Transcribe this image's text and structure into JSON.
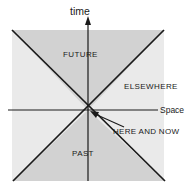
{
  "diagram": {
    "title_label": "time",
    "labels": {
      "time_axis": "time",
      "future_cone": "FUTURE",
      "elsewhere_region": "ELSEWHERE",
      "space_axis": "Space",
      "origin_event": "HERE AND NOW",
      "past_cone": "PAST"
    },
    "colors": {
      "cone_fill": "#d2d2d2",
      "band_fill": "#d2d2d2",
      "line": "#1a1a1a",
      "text": "#1a1a1a",
      "background": "#ffffff"
    },
    "geometry": {
      "origin_x": 88,
      "origin_y": 110,
      "time_axis_top_y": 18,
      "time_axis_bottom_y": 181,
      "space_axis_left_x": 8,
      "space_axis_right_x": 158,
      "band_top_y": 30,
      "band_bottom_y": 181,
      "cone_left_top_x": 12,
      "cone_right_top_x": 164,
      "cone_left_bottom_x": 13,
      "cone_right_bottom_x": 165,
      "pointer_tail_x": 124,
      "pointer_tail_y": 127,
      "pointer_head_x": 91,
      "pointer_head_y": 113
    },
    "icons": {
      "time_arrow": "arrow-up-icon",
      "callout_pointer": "arrow-upleft-icon"
    }
  }
}
